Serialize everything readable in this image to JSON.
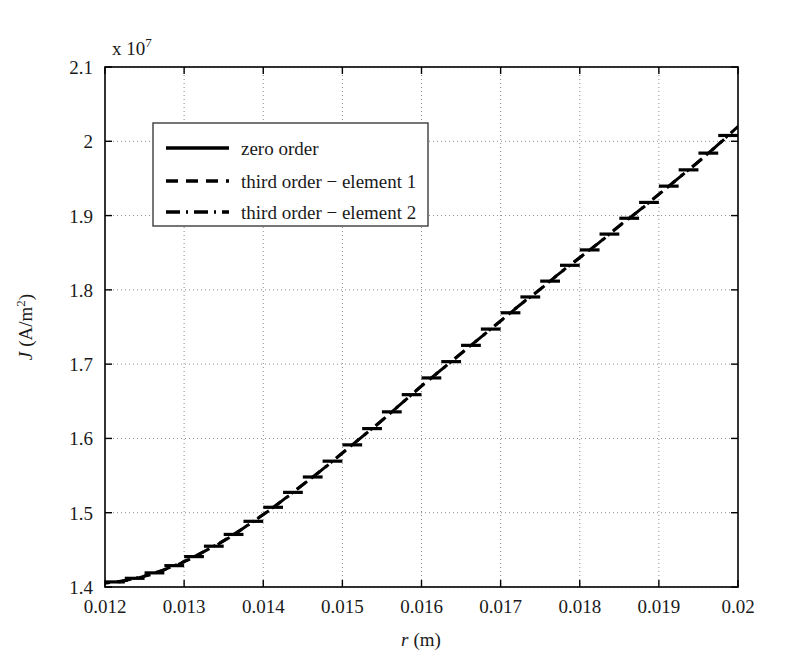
{
  "figure": {
    "background": "#ffffff",
    "foreground": "#000000",
    "grid_color": "#8c8c8c"
  },
  "chart_data": {
    "type": "line",
    "title": "",
    "xlabel": "r (m)",
    "xlabel_symbol": "r",
    "xlabel_unit": "(m)",
    "ylabel": "J (A/m^2)",
    "ylabel_symbol": "J",
    "ylabel_unit": "(A/m",
    "ylabel_exp": "2",
    "ylabel_unit_close": ")",
    "y_exponent_text": "x 10",
    "y_exponent_power": "7",
    "y_scale_factor": 10000000.0,
    "xlim": [
      0.012,
      0.02
    ],
    "ylim": [
      1.4,
      2.1
    ],
    "xticks": [
      0.012,
      0.013,
      0.014,
      0.015,
      0.016,
      0.017,
      0.018,
      0.019,
      0.02
    ],
    "xticklabels": [
      "0.012",
      "0.013",
      "0.014",
      "0.015",
      "0.016",
      "0.017",
      "0.018",
      "0.019",
      "0.02"
    ],
    "yticks": [
      1.4,
      1.5,
      1.6,
      1.7,
      1.8,
      1.9,
      2.0,
      2.1
    ],
    "yticklabels": [
      "1.4",
      "1.5",
      "1.6",
      "1.7",
      "1.8",
      "1.9",
      "2",
      "2.1"
    ],
    "grid": true,
    "grid_style": "dotted",
    "legend_position": "upper-left-inset",
    "n_elements": 32,
    "element_edges": [
      0.012,
      0.01225,
      0.0125,
      0.01275,
      0.013,
      0.01325,
      0.0135,
      0.01375,
      0.014,
      0.01425,
      0.0145,
      0.01475,
      0.015,
      0.01525,
      0.0155,
      0.01575,
      0.016,
      0.01625,
      0.0165,
      0.01675,
      0.017,
      0.01725,
      0.0175,
      0.01775,
      0.018,
      0.01825,
      0.0185,
      0.01875,
      0.019,
      0.01925,
      0.0195,
      0.01975,
      0.02
    ],
    "series": [
      {
        "name": "zero order",
        "style": "solid",
        "description": "piecewise-constant element averages",
        "values": [
          1.4055,
          1.4085,
          1.4135,
          1.4205,
          1.429,
          1.433,
          1.442,
          1.453,
          1.466,
          1.479,
          1.4865,
          1.4985,
          1.513,
          1.527,
          1.5375,
          1.552,
          1.568,
          1.583,
          1.597,
          1.6125,
          1.629,
          1.645,
          1.66,
          1.676,
          1.693,
          1.709,
          1.725,
          1.742,
          1.759,
          1.776,
          1.793,
          1.81
        ]
      },
      {
        "name": "third order - element 1",
        "style": "dashed",
        "description": "third order solution within element 1 type (sloped segments)"
      },
      {
        "name": "third order - element 2",
        "style": "dash-dot",
        "description": "third order solution within element 2 type (sloped segments)"
      }
    ],
    "curve_x": [
      0.012,
      0.01225,
      0.0125,
      0.01275,
      0.013,
      0.01325,
      0.0135,
      0.01375,
      0.014,
      0.01425,
      0.0145,
      0.01475,
      0.015,
      0.01525,
      0.0155,
      0.01575,
      0.016,
      0.01625,
      0.0165,
      0.01675,
      0.017,
      0.01725,
      0.0175,
      0.01775,
      0.018,
      0.01825,
      0.0185,
      0.01875,
      0.019,
      0.01925,
      0.0195,
      0.01975,
      0.02
    ],
    "curve_y": [
      1.405,
      1.408,
      1.413,
      1.42,
      1.429,
      1.44,
      1.452,
      1.466,
      1.481,
      1.497,
      1.514,
      1.531,
      1.549,
      1.567,
      1.585,
      1.604,
      1.623,
      1.641,
      1.659,
      1.677,
      1.695,
      1.713,
      1.73,
      1.748,
      1.765,
      1.782,
      1.8,
      1.817,
      1.835,
      1.853,
      1.871,
      1.89,
      1.91
    ],
    "curve_y_note": "values in units of 1e7 A/m^2; endpoint of plotted staircase reaches about 2.02e7",
    "y_start": 1.405,
    "y_end": 2.02,
    "annotations": []
  },
  "legend": {
    "entries": [
      {
        "label": "zero order",
        "style": "solid"
      },
      {
        "label": "third order − element 1",
        "style": "dashed"
      },
      {
        "label": "third order − element 2",
        "style": "dash-dot"
      }
    ]
  }
}
